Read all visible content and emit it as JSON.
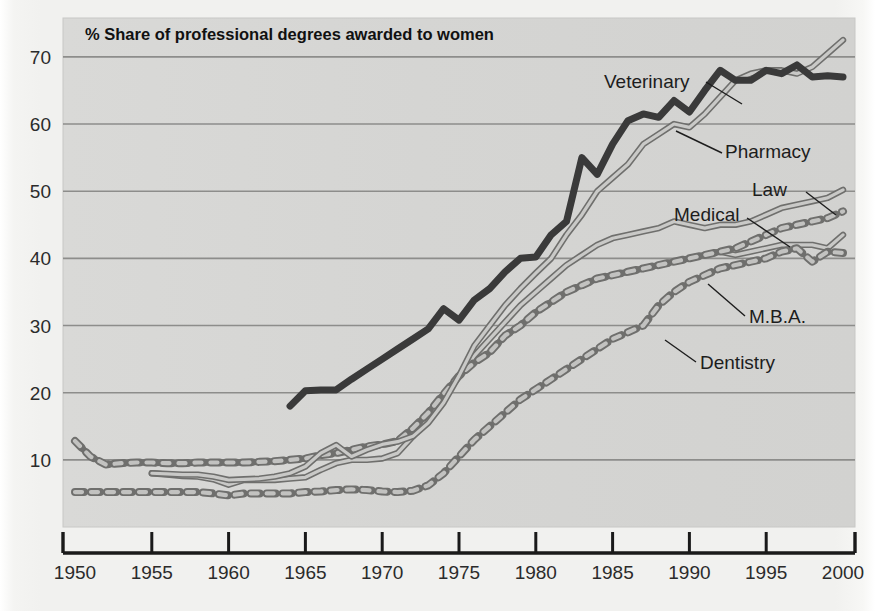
{
  "chart_data": {
    "type": "line",
    "title": "% Share of professional degrees awarded to women",
    "xlabel": "",
    "ylabel": "",
    "xlim": [
      1950,
      2000
    ],
    "ylim": [
      0,
      74
    ],
    "grid": "horizontal",
    "legend_position": "inline-annotations",
    "xticks": [
      1950,
      1955,
      1960,
      1965,
      1970,
      1975,
      1980,
      1985,
      1990,
      1995,
      2000
    ],
    "yticks": [
      10,
      20,
      30,
      40,
      50,
      60,
      70
    ],
    "colors": {
      "plot_background": "#d6d6d4",
      "page_background": "#f1f1ef",
      "gridline": "#8d8d8b",
      "axis": "#1a1a1a",
      "veterinary": "#3a3a3a",
      "pharmacy": "#8e8e8c",
      "law": "#8e8e8c",
      "medical": "#8e8e8c",
      "mba": "#8e8e8c",
      "dentistry": "#8e8e8c",
      "label_text": "#1d1d1d"
    },
    "series": [
      {
        "name": "Veterinary",
        "style": "solid-thick-dark",
        "label": "Veterinary",
        "x": [
          1964,
          1965,
          1966,
          1967,
          1968,
          1969,
          1970,
          1971,
          1972,
          1973,
          1974,
          1975,
          1976,
          1977,
          1978,
          1979,
          1980,
          1981,
          1982,
          1983,
          1984,
          1985,
          1986,
          1987,
          1988,
          1989,
          1990,
          1991,
          1992,
          1993,
          1994,
          1995,
          1996,
          1997,
          1998,
          1999,
          2000
        ],
        "values": [
          18.0,
          20.3,
          20.4,
          20.4,
          22.0,
          23.5,
          25.0,
          26.5,
          28.0,
          29.5,
          32.5,
          30.8,
          33.8,
          35.5,
          38.0,
          40.0,
          40.2,
          43.5,
          45.5,
          55.0,
          52.5,
          57.0,
          60.5,
          61.5,
          61.0,
          63.5,
          61.8,
          65.0,
          68.0,
          66.5,
          66.5,
          68.0,
          67.5,
          68.8,
          67.0,
          67.2,
          67.0
        ]
      },
      {
        "name": "Pharmacy",
        "style": "solid-outline-gray",
        "label": "Pharmacy",
        "x": [
          1955,
          1956,
          1957,
          1958,
          1959,
          1960,
          1961,
          1962,
          1963,
          1964,
          1965,
          1966,
          1967,
          1968,
          1969,
          1970,
          1971,
          1972,
          1973,
          1974,
          1975,
          1976,
          1977,
          1978,
          1979,
          1980,
          1981,
          1982,
          1983,
          1984,
          1985,
          1986,
          1987,
          1988,
          1989,
          1990,
          1991,
          1992,
          1993,
          1994,
          1995,
          1996,
          1997,
          1998,
          1999,
          2000
        ],
        "values": [
          8.0,
          7.9,
          7.8,
          7.8,
          7.5,
          7.0,
          7.1,
          7.2,
          7.5,
          8.0,
          9.0,
          11.0,
          12.2,
          10.5,
          11.5,
          12.3,
          12.7,
          13.5,
          15.5,
          18.5,
          22.5,
          27.0,
          30.0,
          33.0,
          35.5,
          37.8,
          40.0,
          43.5,
          46.5,
          50.0,
          52.0,
          54.0,
          57.0,
          58.5,
          60.0,
          59.5,
          61.5,
          64.0,
          66.5,
          67.5,
          68.0,
          68.0,
          67.5,
          68.5,
          70.5,
          72.5
        ]
      },
      {
        "name": "Law",
        "style": "solid-outline-gray",
        "label": "Law",
        "x": [
          1955,
          1956,
          1957,
          1958,
          1959,
          1960,
          1961,
          1962,
          1963,
          1964,
          1965,
          1966,
          1967,
          1968,
          1969,
          1970,
          1971,
          1972,
          1973,
          1974,
          1975,
          1976,
          1977,
          1978,
          1979,
          1980,
          1981,
          1982,
          1983,
          1984,
          1985,
          1986,
          1987,
          1988,
          1989,
          1990,
          1991,
          1992,
          1993,
          1994,
          1995,
          1996,
          1997,
          1998,
          1999,
          2000
        ],
        "values": [
          8.0,
          7.8,
          7.6,
          7.5,
          7.1,
          6.3,
          7.0,
          7.0,
          7.0,
          7.2,
          7.4,
          8.5,
          9.5,
          10.0,
          10.0,
          10.2,
          11.0,
          13.5,
          16.0,
          19.5,
          22.5,
          25.5,
          28.0,
          30.5,
          33.0,
          35.0,
          37.0,
          39.0,
          40.5,
          42.0,
          43.0,
          43.5,
          44.0,
          44.5,
          45.5,
          45.0,
          44.5,
          45.0,
          45.0,
          45.5,
          46.5,
          47.5,
          48.0,
          48.5,
          49.0,
          50.2
        ]
      },
      {
        "name": "Medical",
        "style": "solid-outline-gray",
        "label": "Medical",
        "x": [
          1950,
          1951,
          1952,
          1953,
          1954,
          1955,
          1956,
          1957,
          1958,
          1959,
          1960,
          1961,
          1962,
          1963,
          1964,
          1965,
          1966,
          1967,
          1968,
          1969,
          1970,
          1971,
          1972,
          1973,
          1974,
          1975,
          1976,
          1977,
          1978,
          1979,
          1980,
          1981,
          1982,
          1983,
          1984,
          1985,
          1986,
          1987,
          1988,
          1989,
          1990,
          1991,
          1992,
          1993,
          1994,
          1995,
          1996,
          1997,
          1998,
          1999,
          2000
        ],
        "values": [
          12.8,
          10.5,
          9.3,
          9.5,
          9.6,
          9.6,
          9.5,
          9.5,
          9.6,
          9.6,
          9.6,
          9.6,
          9.7,
          9.8,
          10.0,
          10.2,
          10.7,
          11.0,
          11.5,
          12.0,
          12.3,
          12.8,
          14.7,
          17.0,
          19.8,
          22.5,
          24.5,
          26.0,
          28.5,
          30.0,
          32.0,
          33.5,
          35.0,
          36.0,
          37.0,
          37.5,
          38.0,
          38.5,
          39.0,
          39.5,
          40.0,
          40.5,
          41.0,
          40.5,
          41.0,
          41.5,
          42.0,
          42.0,
          42.0,
          41.5,
          43.5
        ]
      },
      {
        "name": "M.B.A.",
        "style": "dashed-gray",
        "label": "M.B.A.",
        "x": [
          1950,
          1951,
          1952,
          1953,
          1954,
          1955,
          1956,
          1957,
          1958,
          1959,
          1960,
          1961,
          1962,
          1963,
          1964,
          1965,
          1966,
          1967,
          1968,
          1969,
          1970,
          1971,
          1972,
          1973,
          1974,
          1975,
          1976,
          1977,
          1978,
          1979,
          1980,
          1981,
          1982,
          1983,
          1984,
          1985,
          1986,
          1987,
          1988,
          1989,
          1990,
          1991,
          1992,
          1993,
          1994,
          1995,
          1996,
          1997,
          1998,
          1999,
          2000
        ],
        "values": [
          12.8,
          10.5,
          9.3,
          9.5,
          9.6,
          9.6,
          9.5,
          9.5,
          9.6,
          9.6,
          9.6,
          9.6,
          9.7,
          9.8,
          10.0,
          10.2,
          10.7,
          11.0,
          11.5,
          12.0,
          12.3,
          12.8,
          14.7,
          17.0,
          19.8,
          22.5,
          24.5,
          26.0,
          28.5,
          30.0,
          32.0,
          33.5,
          35.0,
          36.0,
          37.0,
          37.5,
          38.0,
          38.5,
          39.0,
          39.5,
          40.0,
          40.5,
          41.0,
          41.5,
          42.5,
          43.5,
          44.5,
          45.0,
          45.5,
          46.0,
          47.0
        ]
      },
      {
        "name": "Dentistry",
        "style": "dashed-gray",
        "label": "Dentistry",
        "x": [
          1950,
          1951,
          1952,
          1953,
          1954,
          1955,
          1956,
          1957,
          1958,
          1959,
          1960,
          1961,
          1962,
          1963,
          1964,
          1965,
          1966,
          1967,
          1968,
          1969,
          1970,
          1971,
          1972,
          1973,
          1974,
          1975,
          1976,
          1977,
          1978,
          1979,
          1980,
          1981,
          1982,
          1983,
          1984,
          1985,
          1986,
          1987,
          1988,
          1989,
          1990,
          1991,
          1992,
          1993,
          1994,
          1995,
          1996,
          1997,
          1998,
          1999,
          2000
        ],
        "values": [
          5.2,
          5.2,
          5.2,
          5.2,
          5.2,
          5.2,
          5.2,
          5.2,
          5.2,
          5.0,
          4.7,
          5.0,
          5.0,
          5.0,
          5.0,
          5.2,
          5.3,
          5.5,
          5.6,
          5.5,
          5.3,
          5.2,
          5.4,
          6.2,
          8.0,
          10.5,
          13.0,
          15.0,
          17.0,
          19.0,
          20.5,
          22.0,
          23.5,
          25.0,
          26.5,
          28.0,
          29.0,
          30.0,
          33.0,
          35.0,
          36.5,
          37.5,
          38.5,
          39.0,
          39.5,
          40.0,
          41.0,
          41.5,
          39.5,
          41.0,
          40.8
        ]
      }
    ],
    "annotations": [
      {
        "text": "Veterinary",
        "x": 1984,
        "y": 66.5
      },
      {
        "text": "Pharmacy",
        "x": 1992,
        "y": 56.5
      },
      {
        "text": "Law",
        "x": 1994,
        "y": 51.0
      },
      {
        "text": "Medical",
        "x": 1989,
        "y": 47.5
      },
      {
        "text": "M.B.A.",
        "x": 1993,
        "y": 35.5
      },
      {
        "text": "Dentistry",
        "x": 1989,
        "y": 29.0
      }
    ]
  }
}
